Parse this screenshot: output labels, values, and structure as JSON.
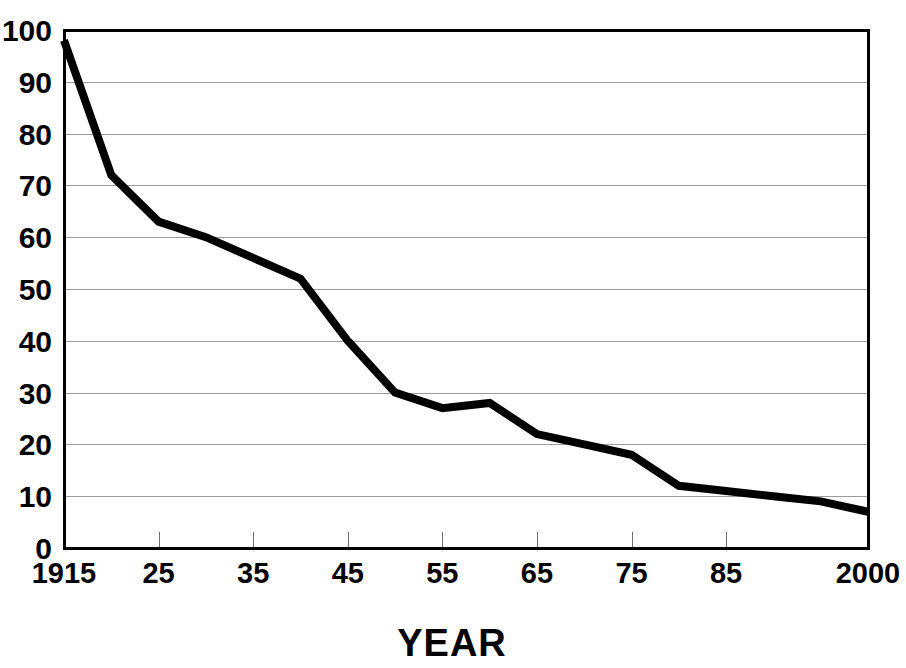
{
  "chart_data": {
    "type": "line",
    "title": "",
    "subtitle": "",
    "xlabel": "YEAR",
    "ylabel": "",
    "grid": true,
    "legend": false,
    "legend_position": "none",
    "xlim": [
      1915,
      2000
    ],
    "ylim": [
      0,
      100
    ],
    "y_ticks": [
      0,
      10,
      20,
      30,
      40,
      50,
      60,
      70,
      80,
      90,
      100
    ],
    "y_tick_labels": [
      "0",
      "10",
      "20",
      "30",
      "40",
      "50",
      "60",
      "70",
      "80",
      "90",
      "100"
    ],
    "x_ticks": [
      1915,
      1925,
      1935,
      1945,
      1955,
      1965,
      1975,
      1985,
      2000
    ],
    "x_tick_labels": [
      "1915",
      "25",
      "35",
      "45",
      "55",
      "65",
      "75",
      "85",
      "2000"
    ],
    "series": [
      {
        "name": "value",
        "color": "#000000",
        "x": [
          1915,
          1920,
          1925,
          1930,
          1935,
          1940,
          1945,
          1950,
          1955,
          1960,
          1965,
          1970,
          1975,
          1980,
          1985,
          1990,
          1995,
          2000
        ],
        "values": [
          98,
          72,
          63,
          60,
          56,
          52,
          40,
          30,
          27,
          28,
          22,
          20,
          18,
          12,
          11,
          10,
          9,
          7
        ]
      }
    ],
    "annotations": []
  },
  "axis": {
    "x_title": "YEAR"
  }
}
